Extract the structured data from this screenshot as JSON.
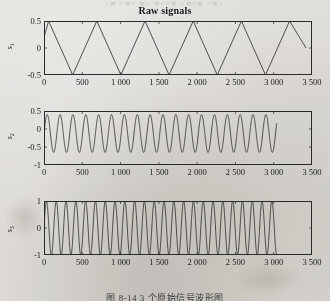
{
  "page": {
    "bleed_through_text": "≡≋ ≡≋≡ ≋≡ ≋≡≡≋ ≡≋≡≋ ≡≋≡",
    "caption": "图 8-14  3 个原始信号波形图"
  },
  "figure": {
    "title": "Raw signals"
  },
  "chart_data": [
    {
      "type": "line",
      "panel_index": 1,
      "title": "Raw signals",
      "xlabel": "",
      "ylabel": "s1",
      "ylabel_base": "s",
      "ylabel_sub": "1",
      "xlim": [
        0,
        3500
      ],
      "ylim": [
        -0.5,
        0.5
      ],
      "xticks": [
        0,
        500,
        1000,
        1500,
        2000,
        2500,
        3000,
        3500
      ],
      "xticklabels": [
        "0",
        "500",
        "1 000",
        "1 500",
        "2 000",
        "2 500",
        "3 000",
        "3 500"
      ],
      "yticks": [
        0.5,
        0,
        -0.5
      ],
      "yticklabels": [
        "0.5",
        "0",
        "-0.5"
      ],
      "grid": false,
      "legend": "none",
      "waveform": "triangle",
      "amplitude": 0.5,
      "period": 630,
      "phase_offset": 60,
      "data_end_x": 3040,
      "cycles_visible": 4.8,
      "line_color": "#2a2a2a",
      "description": "Triangular sawtooth wave oscillating between -0.5 and 0.5"
    },
    {
      "type": "line",
      "panel_index": 2,
      "title": "",
      "xlabel": "",
      "ylabel": "s2",
      "ylabel_base": "s",
      "ylabel_sub": "2",
      "xlim": [
        0,
        3500
      ],
      "ylim": [
        -1,
        0.5
      ],
      "xticks": [
        0,
        500,
        1000,
        1500,
        2000,
        2500,
        3000,
        3500
      ],
      "xticklabels": [
        "0",
        "500",
        "1 000",
        "1 500",
        "2 000",
        "2 500",
        "3 000",
        "3 500"
      ],
      "yticks": [
        0.5,
        0,
        -0.5,
        -1
      ],
      "yticklabels": [
        "0.5",
        "0",
        "-0.5",
        "-1"
      ],
      "grid": false,
      "legend": "none",
      "waveform": "sine",
      "peak": 0.4,
      "trough": -0.65,
      "period": 168,
      "data_end_x": 3040,
      "cycles_visible": 18,
      "line_color": "#2a2a2a",
      "description": "Sinusoid with peaks near 0.4 and troughs near -0.65"
    },
    {
      "type": "line",
      "panel_index": 3,
      "title": "",
      "xlabel": "",
      "ylabel": "s3",
      "ylabel_base": "s",
      "ylabel_sub": "3",
      "xlim": [
        0,
        3500
      ],
      "ylim": [
        -1,
        1
      ],
      "xticks": [
        0,
        500,
        1000,
        1500,
        2000,
        2500,
        3000,
        3500
      ],
      "xticklabels": [
        "0",
        "500",
        "1 000",
        "1 500",
        "2 000",
        "2 500",
        "3 000",
        "3 500"
      ],
      "yticks": [
        1,
        0,
        -1
      ],
      "yticklabels": [
        "1",
        "0",
        "-1"
      ],
      "grid": false,
      "legend": "none",
      "waveform": "sine",
      "peak": 1.0,
      "trough": -1.0,
      "period": 128,
      "data_end_x": 3040,
      "cycles_visible": 24,
      "line_color": "#2a2a2a",
      "description": "High-frequency sinusoid spanning the full -1 to 1 range"
    }
  ]
}
